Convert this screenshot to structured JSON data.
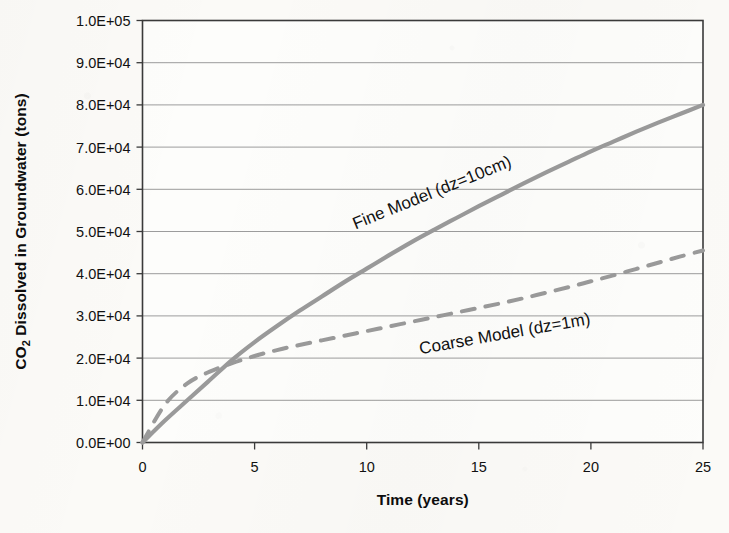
{
  "figure": {
    "background_color": "#fbfaf7",
    "frame_color": "#3a3a3a",
    "gridline_color": "#9c9c9c",
    "series_color": "#9a9a9a"
  },
  "chart_data": {
    "type": "line",
    "title": "",
    "xlabel": "Time (years)",
    "ylabel": "CO2 Dissolved in Groundwater (tons)",
    "ylabel_prefix": "CO",
    "ylabel_subscript": "2",
    "ylabel_suffix": " Dissolved in Groundwater (tons)",
    "xlim": [
      0,
      25
    ],
    "ylim": [
      0,
      100000
    ],
    "grid": "horizontal",
    "legend": "inline-annotations",
    "xticks": [
      0,
      5,
      10,
      15,
      20,
      25
    ],
    "xtick_labels": [
      "0",
      "5",
      "10",
      "15",
      "20",
      "25"
    ],
    "yticks": [
      0,
      10000,
      20000,
      30000,
      40000,
      50000,
      60000,
      70000,
      80000,
      90000,
      100000
    ],
    "ytick_labels": [
      "0.0E+00",
      "1.0E+04",
      "2.0E+04",
      "3.0E+04",
      "4.0E+04",
      "5.0E+04",
      "6.0E+04",
      "7.0E+04",
      "8.0E+04",
      "9.0E+04",
      "1.0E+05"
    ],
    "x": [
      0,
      1,
      2,
      3,
      4,
      5,
      6,
      7,
      8,
      9,
      10,
      11,
      12,
      13,
      14,
      15,
      16,
      17,
      18,
      19,
      20,
      21,
      22,
      23,
      24,
      25
    ],
    "series": [
      {
        "name": "Fine Model (dz=10cm)",
        "style": "solid",
        "color": "#9a9a9a",
        "annotation_label": "Fine Model (dz=10cm)",
        "values": [
          0,
          5200,
          10000,
          14800,
          19600,
          23800,
          27600,
          31200,
          34600,
          38000,
          41200,
          44400,
          47500,
          50400,
          53200,
          56000,
          58700,
          61400,
          64000,
          66500,
          69000,
          71300,
          73600,
          75800,
          77900,
          80000
        ]
      },
      {
        "name": "Coarse Model (dz=1m)",
        "style": "dashed",
        "color": "#9a9a9a",
        "annotation_label": "Coarse Model (dz=1m)",
        "values": [
          0,
          9000,
          14000,
          16800,
          18800,
          20500,
          21900,
          23100,
          24200,
          25300,
          26400,
          27500,
          28600,
          29700,
          30800,
          31900,
          33000,
          34200,
          35500,
          36800,
          38200,
          39600,
          41100,
          42600,
          44100,
          45500
        ]
      }
    ],
    "annotations": [
      {
        "text": "Fine Model (dz=10cm)",
        "x_data": 13.0,
        "y_data": 58000,
        "rotation": -22
      },
      {
        "text": "Coarse Model (dz=1m)",
        "x_data": 16.2,
        "y_data": 24500,
        "rotation": -10
      }
    ]
  }
}
